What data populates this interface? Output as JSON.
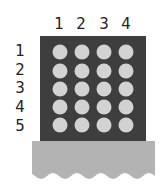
{
  "diagram": {
    "columns": [
      "1",
      "2",
      "3",
      "4"
    ],
    "rows": [
      "1",
      "2",
      "3",
      "4",
      "5"
    ],
    "grid": {
      "rows": 5,
      "cols": 4
    },
    "colors": {
      "panel": "#3e3e3e",
      "hole": "#d2d2d2",
      "base": "#b3b3b3",
      "label": "#222222"
    }
  }
}
